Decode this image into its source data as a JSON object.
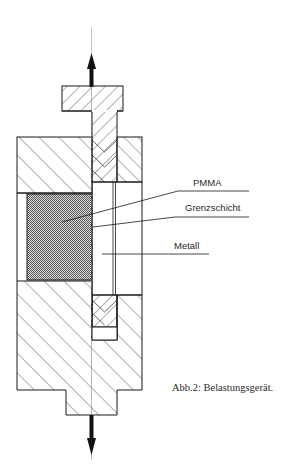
{
  "diagram": {
    "type": "technical-cross-section",
    "labels": {
      "pmma": "PMMA",
      "grenzschicht": "Grenzschicht",
      "metall": "Metall"
    },
    "caption": "Abb.2: Belastungsgerät.",
    "arrows": {
      "top": "tensile-load-up",
      "bottom": "tensile-load-down"
    },
    "colors": {
      "line": "#1a1a1a",
      "hatch": "#3a3a3a",
      "stipple": "#555555",
      "background": "#ffffff"
    }
  }
}
